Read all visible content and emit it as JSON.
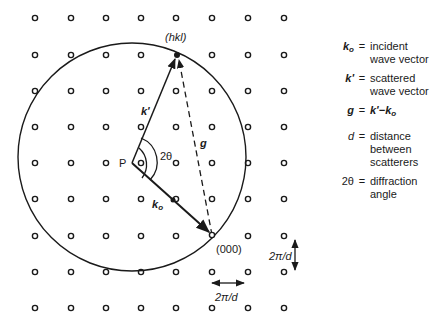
{
  "figure": {
    "lattice": {
      "columns_x": [
        35,
        71,
        106,
        141,
        176,
        212,
        248,
        284
      ],
      "rows_y": [
        18,
        55,
        91,
        127,
        163,
        199,
        236,
        272,
        308
      ],
      "point_style": "open-circle"
    },
    "ewald_sphere": {
      "center": [
        132,
        157
      ],
      "radius": 114
    },
    "points": {
      "P": {
        "label": "P",
        "x": 132,
        "y": 163
      },
      "hkl": {
        "label": "(hkl)",
        "x": 177,
        "y": 55
      },
      "origin": {
        "label": "(000)",
        "x": 212,
        "y": 235
      }
    },
    "vectors": {
      "k_prime": {
        "symbol": "k'",
        "from": "P",
        "to": "hkl",
        "style": "solid-arrow"
      },
      "k0": {
        "symbol": "k",
        "subscript": "o",
        "from": "P",
        "to": "origin",
        "style": "solid-arrow"
      },
      "g": {
        "symbol": "g",
        "from": "origin",
        "to": "hkl",
        "style": "dashed-arrow"
      }
    },
    "angle_label": "2θ",
    "spacing_labels": {
      "vertical": "2π/d",
      "horizontal": "2π/d"
    }
  },
  "legend": [
    {
      "symbol": "k",
      "sub": "o",
      "eq": "=",
      "text1": "incident",
      "text2": "wave vector"
    },
    {
      "symbol": "k'",
      "sub": "",
      "eq": "=",
      "text1": "scattered",
      "text2": "wave vector"
    },
    {
      "symbol": "g",
      "sub": "",
      "eq": "=",
      "text1": "k'−k",
      "text1_sub": "o",
      "text2": ""
    },
    {
      "symbol": "d",
      "sub": "",
      "eq": "=",
      "text1": "distance",
      "text2": "between",
      "text3": "scatterers"
    },
    {
      "symbol": "2θ",
      "sub": "",
      "eq": "=",
      "text1": "diffraction",
      "text2": "angle"
    }
  ]
}
